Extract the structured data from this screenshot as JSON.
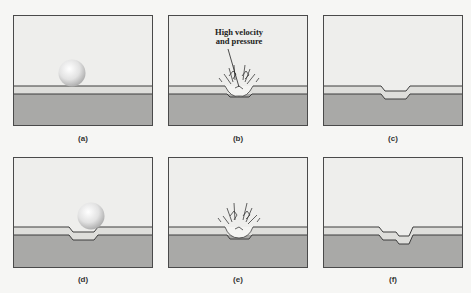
{
  "figure": {
    "panels": [
      {
        "id": "a",
        "caption": "(a)",
        "stage": "sphere approaching coated surface"
      },
      {
        "id": "b",
        "caption": "(b)",
        "stage": "impact with splash",
        "annotation": "High velocity\nand pressure"
      },
      {
        "id": "c",
        "caption": "(c)",
        "stage": "single dent in coating and substrate"
      },
      {
        "id": "d",
        "caption": "(d)",
        "stage": "second sphere approaching dented surface"
      },
      {
        "id": "e",
        "caption": "(e)",
        "stage": "second impact with splash"
      },
      {
        "id": "f",
        "caption": "(f)",
        "stage": "double dent"
      }
    ],
    "annotation_line1": "High velocity",
    "annotation_line2": "and pressure",
    "colors": {
      "background": "#f6f6f4",
      "air": "#eeeeec",
      "coating": "#dededb",
      "substrate": "#a9a9a7",
      "line": "#3c3c3c",
      "sphere_light": "#ffffff",
      "sphere_dark": "#b4b4b4"
    }
  }
}
